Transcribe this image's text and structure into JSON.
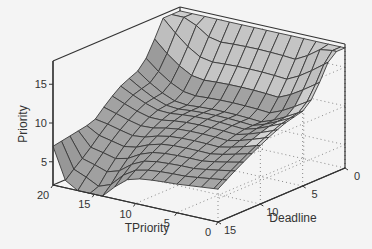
{
  "chart_data": {
    "type": "surface",
    "title": "",
    "xlabel": "TPriority",
    "ylabel": "Deadline",
    "zlabel": "Priority",
    "x_ticks": [
      20,
      15,
      10,
      5,
      0
    ],
    "y_ticks": [
      15,
      10,
      5,
      0
    ],
    "z_ticks": [
      5,
      10,
      15
    ],
    "xlim": [
      0,
      20
    ],
    "ylim": [
      0,
      15
    ],
    "zlim": [
      2,
      18
    ],
    "grid": true,
    "colors": {
      "surface_fill": "#a8a8a8",
      "surface_fill_light": "#d2d2d2",
      "mesh_line": "#3a3a3a",
      "box_line": "#333333",
      "grid_dots": "#888888",
      "background": "#f4f4f4"
    },
    "x": [
      20,
      18.5,
      17,
      15.5,
      14,
      12.5,
      11,
      9.5,
      8,
      6.5,
      5,
      3.5,
      2,
      0.5,
      0
    ],
    "y": [
      0,
      1,
      2,
      3,
      4,
      5,
      6,
      7,
      8,
      9,
      10,
      11,
      12,
      13,
      14,
      15
    ],
    "z_description": "Priority surface: high (~17) along Deadline near 0 and rising at low TPriority; valley (~6-9) for mid values; drops to ~2 at TPriority≈15, Deadline=15"
  }
}
